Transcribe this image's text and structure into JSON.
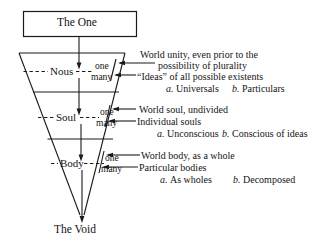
{
  "diagram": {
    "title_box": {
      "label": "The One"
    },
    "bottom": {
      "label": "The Void"
    },
    "levels": [
      {
        "name": "Nous",
        "one_label": "one",
        "many_label": "many",
        "one_desc_line1": "World unity, even prior to the",
        "one_desc_line2": "possibility of plurality",
        "many_desc": "“Ideas” of all possible existents",
        "sub_a_marker": "a.",
        "sub_a_label": "Universals",
        "sub_b_marker": "b.",
        "sub_b_label": "Particulars"
      },
      {
        "name": "Soul",
        "one_label": "one",
        "many_label": "many",
        "one_desc": "World soul, undivided",
        "many_desc": "Individual souls",
        "sub_a_marker": "a.",
        "sub_a_label": "Unconscious",
        "sub_b_marker": "b.",
        "sub_b_label": "Conscious of ideas"
      },
      {
        "name": "Body",
        "one_label": "one",
        "many_label": "many",
        "one_desc": "World body, as a whole",
        "many_desc": "Particular bodies",
        "sub_a_marker": "a.",
        "sub_a_label": "As wholes",
        "sub_b_marker": "b.",
        "sub_b_label": "Decomposed"
      }
    ],
    "colors": {
      "ink": "#141414",
      "background": "#ffffff"
    }
  }
}
